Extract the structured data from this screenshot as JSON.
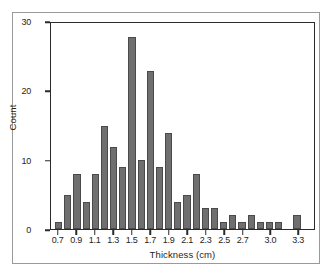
{
  "chart_data": {
    "type": "bar",
    "title": "",
    "subtitle": "",
    "xlabel": "Thickness (cm)",
    "ylabel": "Count",
    "xlim": [
      0.6,
      3.5
    ],
    "ylim": [
      0,
      30
    ],
    "grid": false,
    "legend": null,
    "bin_width": 0.1,
    "bar_color": "#6f6f6f",
    "axis_color": "#2b2b2b",
    "yticks": [
      0,
      10,
      20,
      30
    ],
    "ytick_labels": [
      "0",
      "10",
      "20",
      "30"
    ],
    "xticks": [
      0.7,
      0.9,
      1.1,
      1.3,
      1.5,
      1.7,
      1.9,
      2.1,
      2.3,
      2.5,
      2.7,
      3.0,
      3.3
    ],
    "xtick_labels": [
      "0.7",
      "0.9",
      "1.1",
      "1.3",
      "1.5",
      "1.7",
      "1.9",
      "2.1",
      "2.3",
      "2.5",
      "2.7",
      "3.0",
      "3.3"
    ],
    "categories": [
      "0.7",
      "0.8",
      "0.9",
      "1.0",
      "1.1",
      "1.2",
      "1.3",
      "1.4",
      "1.5",
      "1.6",
      "1.7",
      "1.8",
      "1.9",
      "2.0",
      "2.1",
      "2.2",
      "2.3",
      "2.4",
      "2.5",
      "2.6",
      "2.7",
      "2.8",
      "2.9",
      "3.0",
      "3.1",
      "3.2",
      "3.3",
      "3.4"
    ],
    "values": [
      1,
      5,
      8,
      4,
      8,
      15,
      12,
      9,
      28,
      10,
      23,
      9,
      14,
      4,
      5,
      8,
      3,
      3,
      1,
      2,
      1,
      2,
      1,
      1,
      1,
      0,
      2,
      0
    ],
    "bars": [
      {
        "x": "0.7",
        "value": 1
      },
      {
        "x": "0.8",
        "value": 5
      },
      {
        "x": "0.9",
        "value": 8
      },
      {
        "x": "1.0",
        "value": 4
      },
      {
        "x": "1.1",
        "value": 8
      },
      {
        "x": "1.2",
        "value": 15
      },
      {
        "x": "1.3",
        "value": 12
      },
      {
        "x": "1.4",
        "value": 9
      },
      {
        "x": "1.5",
        "value": 28
      },
      {
        "x": "1.6",
        "value": 10
      },
      {
        "x": "1.7",
        "value": 23
      },
      {
        "x": "1.8",
        "value": 9
      },
      {
        "x": "1.9",
        "value": 14
      },
      {
        "x": "2.0",
        "value": 4
      },
      {
        "x": "2.1",
        "value": 5
      },
      {
        "x": "2.2",
        "value": 8
      },
      {
        "x": "2.3",
        "value": 3
      },
      {
        "x": "2.4",
        "value": 3
      },
      {
        "x": "2.5",
        "value": 1
      },
      {
        "x": "2.6",
        "value": 2
      },
      {
        "x": "2.7",
        "value": 1
      },
      {
        "x": "2.8",
        "value": 2
      },
      {
        "x": "2.9",
        "value": 1
      },
      {
        "x": "3.0",
        "value": 1
      },
      {
        "x": "3.1",
        "value": 1
      },
      {
        "x": "3.2",
        "value": 0
      },
      {
        "x": "3.3",
        "value": 2
      },
      {
        "x": "3.4",
        "value": 0
      }
    ]
  }
}
